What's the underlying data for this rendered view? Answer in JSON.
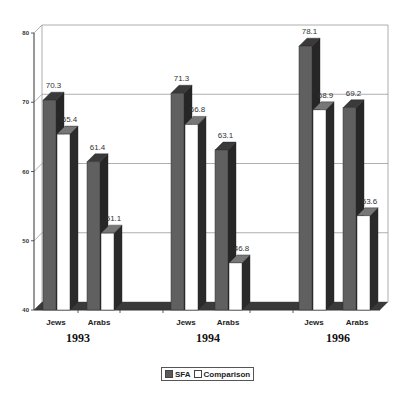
{
  "chart_data": {
    "type": "bar",
    "style": "3d-clustered-column",
    "title": "",
    "xlabel": "",
    "ylabel": "",
    "ylim": [
      40,
      80
    ],
    "yticks": [
      40,
      50,
      60,
      70,
      80
    ],
    "grid": true,
    "legend_position": "bottom",
    "groups": [
      {
        "year": "1993",
        "categories": [
          "Jews",
          "Arabs"
        ]
      },
      {
        "year": "1994",
        "categories": [
          "Jews",
          "Arabs"
        ]
      },
      {
        "year": "1996",
        "categories": [
          "Jews",
          "Arabs"
        ]
      }
    ],
    "categories": [
      "1993 Jews",
      "1993 Arabs",
      "1994 Jews",
      "1994 Arabs",
      "1996 Jews",
      "1996 Arabs"
    ],
    "series": [
      {
        "name": "SFA",
        "color": "#5a5a5a",
        "values": [
          70.3,
          61.4,
          71.3,
          63.1,
          78.1,
          69.2
        ]
      },
      {
        "name": "Comparison",
        "color": "#ffffff",
        "values": [
          65.4,
          51.1,
          66.8,
          46.8,
          68.9,
          53.6
        ]
      }
    ]
  },
  "legend": {
    "items": [
      {
        "label": "SFA"
      },
      {
        "label": "Comparison"
      }
    ]
  }
}
